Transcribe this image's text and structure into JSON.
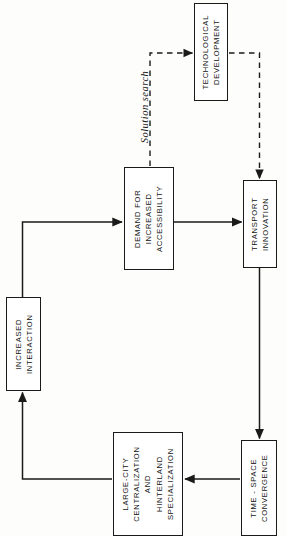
{
  "diagram": {
    "orientation": "text rotated 90 degrees counter-clockwise (sideways page)",
    "canvas": {
      "width": 286,
      "height": 536
    },
    "colors": {
      "background": "#fdfdfb",
      "stroke": "#1a1a1a",
      "node_fill": "#ffffff",
      "text": "#111111"
    },
    "nodes": [
      {
        "id": "technological-development",
        "lines": [
          "TECHNOLOGICAL",
          "DEVELOPMENT"
        ],
        "x": 194,
        "y": 3,
        "w": 34,
        "h": 98
      },
      {
        "id": "demand-accessibility",
        "lines": [
          "DEMAND  FOR",
          "INCREASED",
          "ACCESSIBILITY"
        ],
        "x": 124,
        "y": 167,
        "w": 50,
        "h": 103
      },
      {
        "id": "transport-innovation",
        "lines": [
          "TRANSPORT",
          "INNOVATION"
        ],
        "x": 243,
        "y": 180,
        "w": 34,
        "h": 88
      },
      {
        "id": "increased-interaction",
        "lines": [
          "INCREASED",
          "INTERACTION"
        ],
        "x": 6,
        "y": 297,
        "w": 35,
        "h": 94
      },
      {
        "id": "large-city",
        "lines": [
          "LARGE-CITY",
          "CENTRALIZATION",
          "AND",
          "HINTERLAND",
          "SPECIALIZATION"
        ],
        "x": 113,
        "y": 432,
        "w": 70,
        "h": 104
      },
      {
        "id": "time-space-convergence",
        "lines": [
          "TIME - SPACE",
          "CONVERGENCE"
        ],
        "x": 241,
        "y": 440,
        "w": 36,
        "h": 96
      }
    ],
    "edge_labels": [
      {
        "id": "solution-search",
        "text": "Solution search",
        "style": "italic"
      }
    ],
    "edges": [
      {
        "id": "increased-interaction-to-demand",
        "from": "increased-interaction",
        "to": "demand-accessibility",
        "style": "solid",
        "arrow": true
      },
      {
        "id": "demand-to-transport-innovation",
        "from": "demand-accessibility",
        "to": "transport-innovation",
        "style": "solid",
        "arrow": true
      },
      {
        "id": "demand-to-technological-development",
        "from": "demand-accessibility",
        "to": "technological-development",
        "style": "dashed",
        "arrow": true,
        "label": "Solution search"
      },
      {
        "id": "technological-development-to-transport-innovation",
        "from": "technological-development",
        "to": "transport-innovation",
        "style": "dashed",
        "arrow": true
      },
      {
        "id": "transport-innovation-to-time-space",
        "from": "transport-innovation",
        "to": "time-space-convergence",
        "style": "solid",
        "arrow": true
      },
      {
        "id": "time-space-to-large-city",
        "from": "time-space-convergence",
        "to": "large-city",
        "style": "solid",
        "arrow": true
      },
      {
        "id": "large-city-to-increased-interaction",
        "from": "large-city",
        "to": "increased-interaction",
        "style": "solid",
        "arrow": true
      }
    ]
  }
}
